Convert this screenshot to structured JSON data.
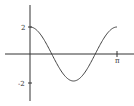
{
  "chart_data": {
    "type": "line",
    "title": "",
    "xlabel": "",
    "ylabel": "",
    "function": "y = 2cos(2x)",
    "x_range": [
      0,
      3.14159
    ],
    "ylim": [
      -2,
      2
    ],
    "x_ticks": [
      {
        "value": 3.14159,
        "label": "π"
      }
    ],
    "y_ticks": [
      {
        "value": 2,
        "label": "2"
      },
      {
        "value": -2,
        "label": "-2"
      }
    ],
    "grid": false,
    "legend": null,
    "series": [
      {
        "name": "2cos(2x)",
        "x": [
          0,
          0.3927,
          0.7854,
          1.1781,
          1.5708,
          1.9635,
          2.3562,
          2.7489,
          3.1416
        ],
        "values": [
          2,
          1.414,
          0,
          -1.414,
          -2,
          -1.414,
          0,
          1.414,
          2
        ]
      }
    ],
    "colors": {
      "axis": "#333333",
      "curve": "#444444"
    }
  },
  "labels": {
    "y_top": "2",
    "y_bottom": "-2",
    "x_pi": "π"
  }
}
